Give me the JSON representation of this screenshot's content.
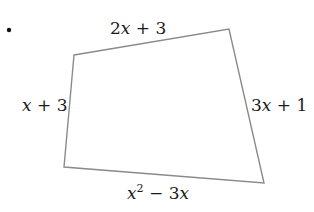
{
  "diagram": {
    "type": "quadrilateral",
    "bullet": "•",
    "vertices": [
      {
        "name": "top-left",
        "x": 74,
        "y": 55
      },
      {
        "name": "top-right",
        "x": 229,
        "y": 29
      },
      {
        "name": "bottom-right",
        "x": 264,
        "y": 183
      },
      {
        "name": "bottom-left",
        "x": 64,
        "y": 167
      }
    ],
    "edge_color": "#8a8a8a",
    "sides": {
      "top": {
        "coef": "2",
        "var": "x",
        "rest": " + 3"
      },
      "left": {
        "coef": "",
        "var": "x",
        "rest": " + 3"
      },
      "right": {
        "coef": "3",
        "var": "x",
        "rest": " + 1"
      },
      "bottom": {
        "var1": "x",
        "exp": "2",
        "mid": " − 3",
        "var2": "x"
      }
    }
  }
}
